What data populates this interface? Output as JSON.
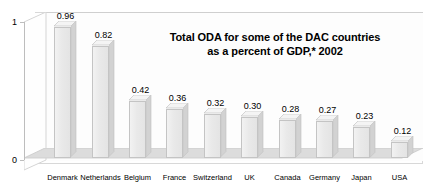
{
  "chart_data": {
    "type": "bar",
    "title": "Total ODA for some of the DAC countries as a percent of GDP,* 2002",
    "title_line1": "Total ODA for some of the DAC countries",
    "title_line2": "as a percent of GDP,* 2002",
    "xlabel": "",
    "ylabel": "",
    "ylim": [
      0,
      1
    ],
    "ytick_labels": [
      "1",
      "0"
    ],
    "grid": false,
    "legend": "none",
    "style": "3d-column",
    "categories": [
      "Denmark",
      "Netherlands",
      "Belgium",
      "France",
      "Switzerland",
      "UK",
      "Canada",
      "Germany",
      "Japan",
      "USA"
    ],
    "values": [
      0.96,
      0.82,
      0.42,
      0.36,
      0.32,
      0.3,
      0.28,
      0.27,
      0.23,
      0.12
    ],
    "value_labels": [
      "0.96",
      "0.82",
      "0.42",
      "0.36",
      "0.32",
      "0.30",
      "0.28",
      "0.27",
      "0.23",
      "0.12"
    ],
    "colors": {
      "bar_face": "#e9e9e9",
      "bar_side": "#d2d2d2",
      "bar_top": "#f4f4f4",
      "bar_outline": "#c4c4c4",
      "floor": "#d9d9d9",
      "wall": "#fdfdfd",
      "axis": "#bdbdbd",
      "text": "#000000",
      "background": "#ffffff"
    }
  }
}
